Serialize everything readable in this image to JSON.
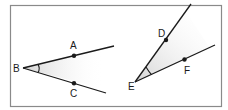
{
  "diagram": {
    "type": "angles",
    "colors": {
      "frame": "#8a8a8a",
      "line": "#1a1a1a",
      "shade": "#d9d9d9",
      "background": "#ffffff"
    },
    "left_angle": {
      "vertex_label": "B",
      "upper_point_label": "A",
      "lower_point_label": "C",
      "name": "angle ABC"
    },
    "right_angle": {
      "vertex_label": "E",
      "upper_point_label": "D",
      "lower_point_label": "F",
      "name": "angle DEF"
    }
  }
}
